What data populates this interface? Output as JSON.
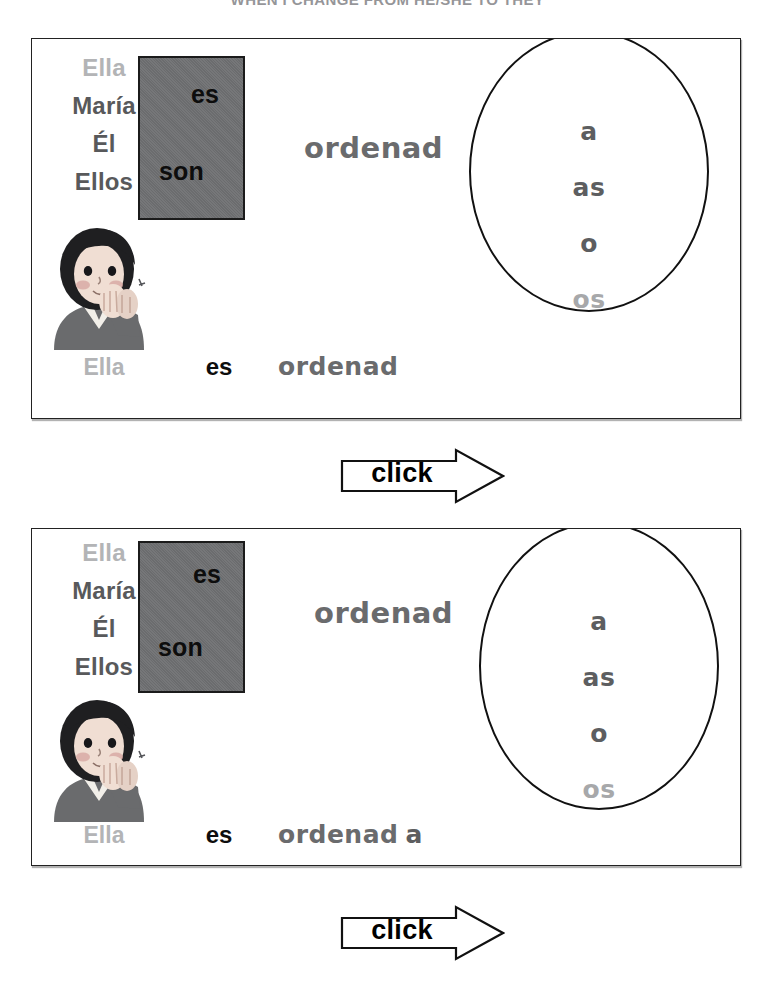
{
  "slide": {
    "title": "WHEN I CHANGE FROM HE/SHE TO THEY"
  },
  "panels": [
    {
      "id": "panel-1",
      "pronouns": [
        {
          "text": "Ella",
          "state": "dim"
        },
        {
          "text": "María",
          "state": "normal"
        },
        {
          "text": "Él",
          "state": "normal"
        },
        {
          "text": "Ellos",
          "state": "normal"
        }
      ],
      "verb_box": {
        "forms": [
          {
            "text": "es"
          },
          {
            "text": "son"
          }
        ]
      },
      "stem": "ordenad",
      "endings": [
        {
          "text": "a",
          "state": "normal"
        },
        {
          "text": "as",
          "state": "normal"
        },
        {
          "text": "o",
          "state": "normal"
        },
        {
          "text": "os",
          "state": "light"
        }
      ],
      "answer": {
        "pronoun": "Ella",
        "verb": "es",
        "stem": "ordenad",
        "ending": ""
      }
    },
    {
      "id": "panel-2",
      "pronouns": [
        {
          "text": "Ella",
          "state": "dim"
        },
        {
          "text": "María",
          "state": "normal"
        },
        {
          "text": "Él",
          "state": "normal"
        },
        {
          "text": "Ellos",
          "state": "normal"
        }
      ],
      "verb_box": {
        "forms": [
          {
            "text": "es"
          },
          {
            "text": "son"
          }
        ]
      },
      "stem": "ordenad",
      "endings": [
        {
          "text": "a",
          "state": "normal"
        },
        {
          "text": "as",
          "state": "normal"
        },
        {
          "text": "o",
          "state": "normal"
        },
        {
          "text": "os",
          "state": "light"
        }
      ],
      "answer": {
        "pronoun": "Ella",
        "verb": "es",
        "stem": "ordenad",
        "ending": "a"
      }
    }
  ],
  "click_buttons": [
    {
      "id": "click-1",
      "label": "click"
    },
    {
      "id": "click-2",
      "label": "click"
    }
  ],
  "colors": {
    "pronoun_normal": "#58595b",
    "pronoun_dim": "#b3b4b6",
    "verb_box_fill": "#6f7072",
    "verb_text": "#0d0d0d",
    "stem_text": "#6a6b6d",
    "ending_normal": "#5d5e60",
    "ending_light": "#a7a8aa",
    "border": "#111111"
  }
}
